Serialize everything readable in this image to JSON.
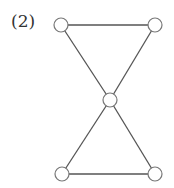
{
  "figure": {
    "label": "(2)",
    "colors": {
      "edge": "#555555",
      "node_stroke": "#777777",
      "node_fill": "#ffffff"
    }
  },
  "graph": {
    "nodes": [
      {
        "id": "top-left",
        "x": 61,
        "y": 25
      },
      {
        "id": "top-right",
        "x": 155,
        "y": 25
      },
      {
        "id": "center",
        "x": 110,
        "y": 100
      },
      {
        "id": "bottom-left",
        "x": 62,
        "y": 174
      },
      {
        "id": "bottom-right",
        "x": 155,
        "y": 174
      }
    ],
    "edges": [
      [
        "top-left",
        "top-right"
      ],
      [
        "top-left",
        "center"
      ],
      [
        "top-right",
        "center"
      ],
      [
        "center",
        "bottom-left"
      ],
      [
        "center",
        "bottom-right"
      ],
      [
        "bottom-left",
        "bottom-right"
      ]
    ],
    "node_radius": 7
  }
}
